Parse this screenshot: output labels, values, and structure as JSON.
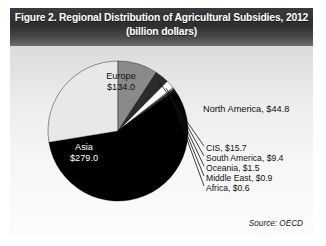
{
  "figure": {
    "title_line1": "Figure 2. Regional Distribution of Agricultural Subsidies, 2012",
    "title_line2": "(billion dollars)",
    "source": "Source: OECD"
  },
  "labels": {
    "europe_name": "Europe",
    "europe_value": "$134.0",
    "asia_name": "Asia",
    "asia_value": "$279.0",
    "north_america": "North America, $44.8",
    "cis": "CIS, $15.7",
    "south_america": "South America, $9.4",
    "oceania": "Oceania, $1.5",
    "middle_east": "Middle East, $0.9",
    "africa": "Africa, $0.6"
  },
  "chart_data": {
    "type": "pie",
    "title": "Figure 2. Regional Distribution of Agricultural Subsidies, 2012 (billion dollars)",
    "unit": "billion dollars",
    "source": "OECD",
    "year": 2012,
    "total": 485.9,
    "legend": "none-inline-labels",
    "categories": [
      "Asia",
      "Europe",
      "North America",
      "CIS",
      "South America",
      "Oceania",
      "Middle East",
      "Africa"
    ],
    "values": [
      279.0,
      134.0,
      44.8,
      15.7,
      9.4,
      1.5,
      0.9,
      0.6
    ],
    "value_labels": [
      "$279.0",
      "$134.0",
      "$44.8",
      "$15.7",
      "$9.4",
      "$1.5",
      "$0.9",
      "$0.6"
    ],
    "colors": [
      "#000000",
      "#e8e8e8",
      "#8a8a8a",
      "#2b2b2b",
      "#ffffff",
      "#bdbdbd",
      "#000000",
      "#d8d8d8"
    ],
    "start_angle_deg": -36,
    "direction": "clockwise"
  },
  "geometry": {
    "cx": 108,
    "cy": 123,
    "r": 70
  }
}
